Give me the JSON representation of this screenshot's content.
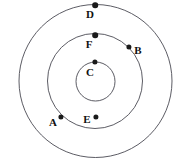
{
  "figure": {
    "name": "concentric-circles-points-diagram",
    "width": 180,
    "height": 164,
    "background_color": "#ffffff",
    "stroke_color": "#4a4a52",
    "dot_color": "#1a1a1a",
    "label_color": "#111111",
    "label_font_size": 11
  },
  "circles": [
    {
      "id": "outer",
      "cx": 95.5,
      "cy": 81.0,
      "r": 76.5,
      "stroke_width": 0.9
    },
    {
      "id": "middle",
      "cx": 95.0,
      "cy": 81.0,
      "r": 47.5,
      "stroke_width": 0.9
    },
    {
      "id": "inner",
      "cx": 95.5,
      "cy": 81.5,
      "r": 19.5,
      "stroke_width": 0.9
    }
  ],
  "points": [
    {
      "id": "A",
      "label": "A",
      "dot_x": 61,
      "dot_y": 117,
      "dot_r": 2.6,
      "label_x": 53,
      "label_y": 122,
      "on_circle": "middle"
    },
    {
      "id": "B",
      "label": "B",
      "dot_x": 129,
      "dot_y": 47,
      "dot_r": 2.6,
      "label_x": 138,
      "label_y": 50,
      "on_circle": "middle"
    },
    {
      "id": "C",
      "label": "C",
      "dot_x": 95,
      "dot_y": 62,
      "dot_r": 2.6,
      "label_x": 90,
      "label_y": 72,
      "on_circle": "inner"
    },
    {
      "id": "D",
      "label": "D",
      "dot_x": 95,
      "dot_y": 5,
      "dot_r": 2.8,
      "label_x": 90,
      "label_y": 14,
      "on_circle": "outer"
    },
    {
      "id": "E",
      "label": "E",
      "dot_x": 96,
      "dot_y": 117,
      "dot_r": 2.6,
      "label_x": 87,
      "label_y": 119,
      "on_circle": "none"
    },
    {
      "id": "F",
      "label": "F",
      "dot_x": 95,
      "dot_y": 35,
      "dot_r": 2.8,
      "label_x": 89,
      "label_y": 44,
      "on_circle": "middle"
    }
  ]
}
